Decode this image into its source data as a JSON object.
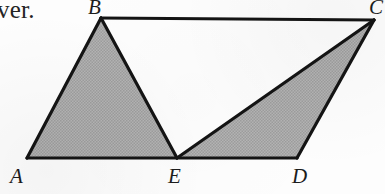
{
  "page": {
    "width": 385,
    "height": 194,
    "background_color": "#fdfdfd",
    "ink_color": "#141414",
    "shade_color": "#adadad"
  },
  "body_text": {
    "fragment": "ver."
  },
  "figure": {
    "kind": "geometry-diagram",
    "vertices": [
      {
        "id": "A",
        "label": "A",
        "x": 27,
        "y": 158,
        "label_x": 10,
        "label_y": 166
      },
      {
        "id": "B",
        "label": "B",
        "x": 101,
        "y": 18,
        "label_x": 88,
        "label_y": -3
      },
      {
        "id": "C",
        "label": "C",
        "x": 374,
        "y": 20,
        "label_x": 369,
        "label_y": -3
      },
      {
        "id": "D",
        "label": "D",
        "x": 297,
        "y": 158,
        "label_x": 292,
        "label_y": 166
      },
      {
        "id": "E",
        "label": "E",
        "x": 177,
        "y": 158,
        "label_x": 168,
        "label_y": 166
      }
    ],
    "edges": [
      {
        "from": "A",
        "to": "B"
      },
      {
        "from": "B",
        "to": "C"
      },
      {
        "from": "C",
        "to": "D"
      },
      {
        "from": "D",
        "to": "A"
      },
      {
        "from": "B",
        "to": "E"
      },
      {
        "from": "E",
        "to": "C"
      }
    ],
    "shaded_regions": [
      {
        "name": "triangle-abe",
        "vertices": [
          "A",
          "B",
          "E"
        ]
      },
      {
        "name": "triangle-ecd",
        "vertices": [
          "E",
          "C",
          "D"
        ]
      }
    ],
    "unshaded_regions": [
      {
        "name": "triangle-bce",
        "vertices": [
          "B",
          "C",
          "E"
        ]
      }
    ]
  }
}
